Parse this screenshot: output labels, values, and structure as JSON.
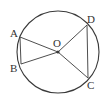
{
  "diagram": {
    "type": "circle-geometry",
    "stroke_color": "#3a3a3a",
    "circle": {
      "center": "O",
      "cx": 58,
      "cy": 52,
      "r": 41
    },
    "points": [
      {
        "name": "A",
        "x": 20,
        "y": 37,
        "label_x": 10,
        "label_y": 37
      },
      {
        "name": "B",
        "x": 21,
        "y": 64,
        "label_x": 10,
        "label_y": 72
      },
      {
        "name": "C",
        "x": 88,
        "y": 78,
        "label_x": 87,
        "label_y": 89
      },
      {
        "name": "D",
        "x": 87,
        "y": 25,
        "label_x": 87,
        "label_y": 23
      },
      {
        "name": "O",
        "x": 58,
        "y": 52,
        "label_x": 53,
        "label_y": 47
      }
    ],
    "segments": [
      [
        "A",
        "B"
      ],
      [
        "O",
        "A"
      ],
      [
        "O",
        "B"
      ],
      [
        "O",
        "C"
      ],
      [
        "O",
        "D"
      ],
      [
        "D",
        "C"
      ]
    ],
    "labels": {
      "A": "A",
      "B": "B",
      "C": "C",
      "D": "D",
      "O": "O"
    }
  }
}
